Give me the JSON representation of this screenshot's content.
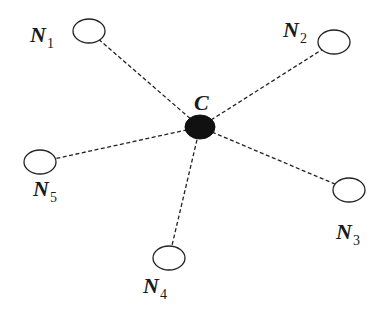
{
  "diagram": {
    "type": "star-topology",
    "center": {
      "id": "C",
      "label": "C",
      "x": 200,
      "y": 127,
      "rx": 15,
      "ry": 12,
      "fill": "#111111",
      "label_x": 194,
      "label_y": 110
    },
    "nodes": [
      {
        "id": "N1",
        "base": "N",
        "sub": "1",
        "x": 89,
        "y": 31,
        "label_x": 30,
        "label_y": 42
      },
      {
        "id": "N2",
        "base": "N",
        "sub": "2",
        "x": 334,
        "y": 42,
        "label_x": 283,
        "label_y": 37
      },
      {
        "id": "N3",
        "base": "N",
        "sub": "3",
        "x": 349,
        "y": 190,
        "label_x": 336,
        "label_y": 239
      },
      {
        "id": "N4",
        "base": "N",
        "sub": "4",
        "x": 169,
        "y": 258,
        "label_x": 143,
        "label_y": 293
      },
      {
        "id": "N5",
        "base": "N",
        "sub": "5",
        "x": 40,
        "y": 162,
        "label_x": 33,
        "label_y": 196
      }
    ],
    "edges": [
      {
        "from": "C",
        "to": "N1",
        "style": "dashed"
      },
      {
        "from": "C",
        "to": "N2",
        "style": "dashed"
      },
      {
        "from": "C",
        "to": "N3",
        "style": "dashed"
      },
      {
        "from": "C",
        "to": "N4",
        "style": "dashed"
      },
      {
        "from": "C",
        "to": "N5",
        "style": "dashed"
      }
    ],
    "node_style": {
      "rx": 16,
      "ry": 12,
      "fill": "#ffffff",
      "stroke": "#222222"
    }
  }
}
